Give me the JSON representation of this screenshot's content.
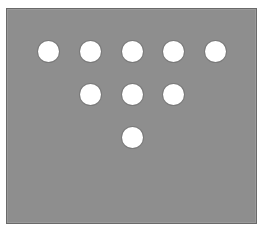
{
  "figure": {
    "background_color": "#8e8e8e",
    "border_color": "#6a6a6a",
    "dot_color": "#ffffff",
    "dot_count": 9,
    "arrangement": "inverted triangle: 5 / 3 / 1",
    "rows": [
      {
        "row": 1,
        "count": 5,
        "y": 51,
        "x": [
          48,
          90,
          132,
          173,
          215
        ]
      },
      {
        "row": 2,
        "count": 3,
        "y": 94,
        "x": [
          90,
          132,
          173
        ]
      },
      {
        "row": 3,
        "count": 1,
        "y": 137,
        "x": [
          132
        ]
      }
    ]
  }
}
